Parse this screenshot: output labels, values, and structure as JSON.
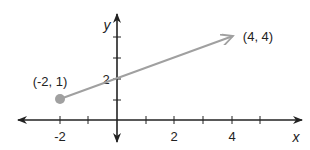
{
  "diagram": {
    "type": "coordinate-plane-ray",
    "axes": {
      "x_label": "x",
      "y_label": "y",
      "x_tick_labels": [
        "-2",
        "2",
        "4"
      ],
      "y_tick_labels": [
        "2"
      ]
    },
    "points": {
      "start": {
        "label": "(-2, 1)",
        "x": -2,
        "y": 1
      },
      "end": {
        "label": "(4, 4)",
        "x": 4,
        "y": 4
      }
    },
    "colors": {
      "axis": "#222222",
      "ray": "#a0a0a0",
      "point": "#a0a0a0"
    }
  }
}
